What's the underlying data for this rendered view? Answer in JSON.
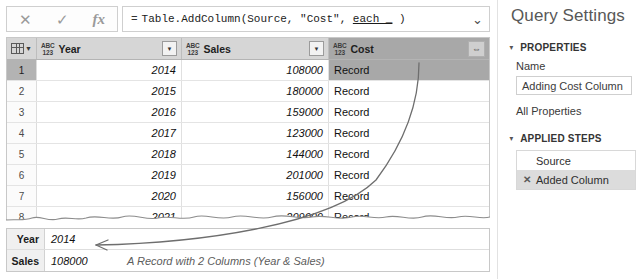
{
  "formula_bar": {
    "cancel_icon": "close-icon",
    "accept_icon": "check-icon",
    "fx_icon": "fx-icon",
    "equals": "=",
    "formula_prefix": "Table.AddColumn(Source, \"Cost\", ",
    "formula_underlined": "each _",
    "formula_suffix": " )",
    "full_formula": "= Table.AddColumn(Source, \"Cost\", each _ )",
    "expand_icon": "chevron-down-icon"
  },
  "grid": {
    "corner_icon": "select-all-table-icon",
    "type_icon_top": "ABC",
    "type_icon_bottom": "123",
    "filter_icon": "chevron-down-icon",
    "expand_icon": "expand-columns-icon",
    "columns": [
      {
        "name": "Year",
        "type": "ABC123",
        "has_filter": true,
        "has_expand": false
      },
      {
        "name": "Sales",
        "type": "ABC123",
        "has_filter": true,
        "has_expand": false
      },
      {
        "name": "Cost",
        "type": "ABC123",
        "has_filter": false,
        "has_expand": true
      }
    ],
    "rows": [
      {
        "n": "1",
        "year": "2014",
        "sales": "108000",
        "cost": "Record",
        "selected": true
      },
      {
        "n": "2",
        "year": "2015",
        "sales": "180000",
        "cost": "Record",
        "selected": false
      },
      {
        "n": "3",
        "year": "2016",
        "sales": "159000",
        "cost": "Record",
        "selected": false
      },
      {
        "n": "4",
        "year": "2017",
        "sales": "123000",
        "cost": "Record",
        "selected": false
      },
      {
        "n": "5",
        "year": "2018",
        "sales": "144000",
        "cost": "Record",
        "selected": false
      },
      {
        "n": "6",
        "year": "2019",
        "sales": "201000",
        "cost": "Record",
        "selected": false
      },
      {
        "n": "7",
        "year": "2020",
        "sales": "156000",
        "cost": "Record",
        "selected": false
      },
      {
        "n": "8",
        "year": "2021",
        "sales": "209000",
        "cost": "Record",
        "selected": false
      }
    ]
  },
  "preview": {
    "row1_key": "Year",
    "row1_value": "2014",
    "row2_key": "Sales",
    "row2_value": "108000",
    "annotation": "A Record with 2 Columns (Year & Sales)"
  },
  "query_settings": {
    "title": "Query Settings",
    "properties_header": "PROPERTIES",
    "name_label": "Name",
    "name_value": "Adding Cost Column",
    "all_properties": "All Properties",
    "applied_steps_header": "APPLIED STEPS",
    "steps": [
      {
        "label": "Source",
        "icon": "",
        "active": false
      },
      {
        "label": "Added Column",
        "icon": "custom-step-icon",
        "active": true
      }
    ],
    "collapse_icon": "triangle-down-icon"
  },
  "colors": {
    "header_bg": "#d6d6d6",
    "selected_bg": "#a8a8a8",
    "panel_text": "#585858",
    "annotation_stroke": "#6e6e6e"
  }
}
